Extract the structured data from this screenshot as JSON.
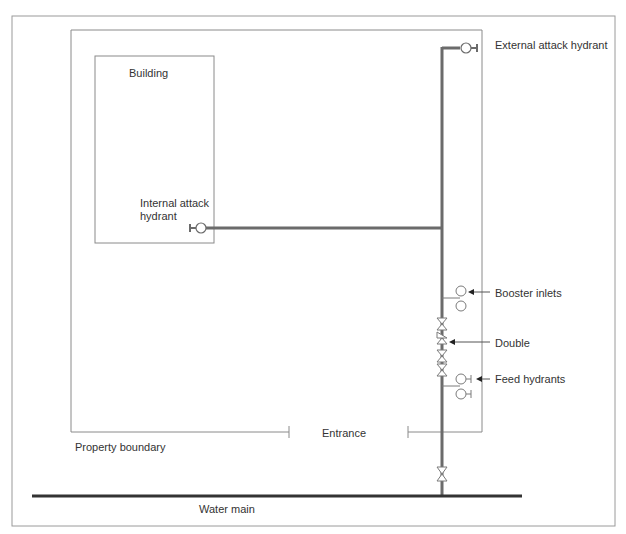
{
  "diagram": {
    "labels": {
      "building": "Building",
      "internal_hydrant_1": "Internal attack",
      "internal_hydrant_2": "hydrant",
      "external_hydrant": "External attack hydrant",
      "booster_inlets": "Booster inlets",
      "double": "Double",
      "feed_hydrants": "Feed hydrants",
      "entrance": "Entrance",
      "property_boundary": "Property boundary",
      "water_main": "Water main"
    },
    "colors": {
      "pipe": "#6b6b6b",
      "outline": "#8a8a8a",
      "main": "#333333",
      "text": "#333333"
    }
  }
}
